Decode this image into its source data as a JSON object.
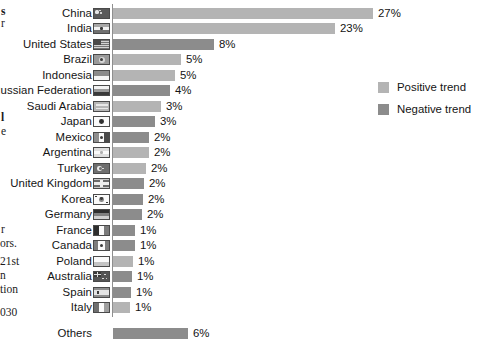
{
  "margin_text": {
    "lines": [
      {
        "text": "s",
        "top": 6,
        "left": 1,
        "bold": true
      },
      {
        "text": "r",
        "top": 18,
        "left": 1,
        "bold": false
      },
      {
        "text": "l",
        "top": 112,
        "left": 1,
        "bold": true
      },
      {
        "text": "e",
        "top": 126,
        "left": 1,
        "bold": false
      },
      {
        "text": "r",
        "top": 224,
        "left": 1,
        "bold": false
      },
      {
        "text": "ors.",
        "top": 238,
        "left": 0,
        "bold": false
      },
      {
        "text": "21st",
        "top": 256,
        "left": 0,
        "bold": false
      },
      {
        "text": "n",
        "top": 270,
        "left": 0,
        "bold": false
      },
      {
        "text": "tion",
        "top": 284,
        "left": 0,
        "bold": false
      },
      {
        "text": "030",
        "top": 307,
        "left": 0,
        "bold": false
      }
    ]
  },
  "legend": {
    "items": [
      {
        "label": "Positive trend",
        "color": "#b4b4b4",
        "swatch_name": "legend-swatch-positive"
      },
      {
        "label": "Negative trend",
        "color": "#8c8c8c",
        "swatch_name": "legend-swatch-negative"
      }
    ]
  },
  "chart_data": {
    "type": "bar",
    "orientation": "horizontal",
    "title": "",
    "xlabel": "",
    "ylabel": "",
    "xlim": [
      0,
      27
    ],
    "grid": false,
    "legend_position": "right",
    "value_suffix": "%",
    "series": [
      {
        "name": "Positive trend",
        "color": "#b4b4b4"
      },
      {
        "name": "Negative trend",
        "color": "#8c8c8c"
      }
    ],
    "categories": [
      "China",
      "India",
      "United States",
      "Brazil",
      "Indonesia",
      "Russian Federation",
      "Saudi Arabia",
      "Japan",
      "Mexico",
      "Argentina",
      "Turkey",
      "United Kingdom",
      "Korea",
      "Germany",
      "France",
      "Canada",
      "Poland",
      "Australia",
      "Spain",
      "Italy",
      "Others"
    ],
    "values": [
      27,
      23,
      8,
      5,
      5,
      4,
      3,
      3,
      2,
      2,
      2,
      2,
      2,
      2,
      1,
      1,
      1,
      1,
      1,
      1,
      6
    ],
    "labels": [
      "27%",
      "23%",
      "8%",
      "5%",
      "5%",
      "4%",
      "3%",
      "3%",
      "2%",
      "2%",
      "2%",
      "2%",
      "2%",
      "2%",
      "1%",
      "1%",
      "1%",
      "1%",
      "1%",
      "1%",
      "6%"
    ],
    "trends": [
      "positive",
      "positive",
      "negative",
      "positive",
      "positive",
      "negative",
      "positive",
      "negative",
      "negative",
      "positive",
      "positive",
      "negative",
      "negative",
      "negative",
      "negative",
      "negative",
      "positive",
      "negative",
      "negative",
      "positive",
      "negative"
    ],
    "bars": [
      {
        "category": "China",
        "label": "China",
        "value": 27,
        "value_label": "27%",
        "trend": "positive",
        "color": "#b4b4b4",
        "pixel_width": 260,
        "top": 6,
        "flag": "flag-china",
        "has_flag": true
      },
      {
        "category": "India",
        "label": "India",
        "value": 23,
        "value_label": "23%",
        "trend": "positive",
        "color": "#b4b4b4",
        "pixel_width": 222,
        "top": 21,
        "flag": "flag-india",
        "has_flag": true
      },
      {
        "category": "United States",
        "label": "United States",
        "value": 8,
        "value_label": "8%",
        "trend": "negative",
        "color": "#8c8c8c",
        "pixel_width": 101,
        "top": 37,
        "flag": "flag-united-states",
        "has_flag": true
      },
      {
        "category": "Brazil",
        "label": "Brazil",
        "value": 5,
        "value_label": "5%",
        "trend": "positive",
        "color": "#b4b4b4",
        "pixel_width": 68,
        "top": 52,
        "flag": "flag-brazil",
        "has_flag": true
      },
      {
        "category": "Indonesia",
        "label": "Indonesia",
        "value": 5,
        "value_label": "5%",
        "trend": "positive",
        "color": "#b4b4b4",
        "pixel_width": 62,
        "top": 68,
        "flag": "flag-indonesia",
        "has_flag": true
      },
      {
        "category": "Russian Federation",
        "label": "Russian Federation",
        "value": 4,
        "value_label": "4%",
        "trend": "negative",
        "color": "#8c8c8c",
        "pixel_width": 57,
        "top": 83,
        "flag": "flag-russia",
        "has_flag": true
      },
      {
        "category": "Saudi Arabia",
        "label": "Saudi Arabia",
        "value": 3,
        "value_label": "3%",
        "trend": "positive",
        "color": "#b4b4b4",
        "pixel_width": 48,
        "top": 99,
        "flag": "flag-saudi-arabia",
        "has_flag": true
      },
      {
        "category": "Japan",
        "label": "Japan",
        "value": 3,
        "value_label": "3%",
        "trend": "negative",
        "color": "#8c8c8c",
        "pixel_width": 42,
        "top": 114,
        "flag": "flag-japan",
        "has_flag": true
      },
      {
        "category": "Mexico",
        "label": "Mexico",
        "value": 2,
        "value_label": "2%",
        "trend": "negative",
        "color": "#8c8c8c",
        "pixel_width": 36,
        "top": 130,
        "flag": "flag-mexico",
        "has_flag": true
      },
      {
        "category": "Argentina",
        "label": "Argentina",
        "value": 2,
        "value_label": "2%",
        "trend": "positive",
        "color": "#b4b4b4",
        "pixel_width": 36,
        "top": 145,
        "flag": "flag-argentina",
        "has_flag": true
      },
      {
        "category": "Turkey",
        "label": "Turkey",
        "value": 2,
        "value_label": "2%",
        "trend": "positive",
        "color": "#b4b4b4",
        "pixel_width": 33,
        "top": 161,
        "flag": "flag-turkey",
        "has_flag": true
      },
      {
        "category": "United Kingdom",
        "label": "United Kingdom",
        "value": 2,
        "value_label": "2%",
        "trend": "negative",
        "color": "#8c8c8c",
        "pixel_width": 31,
        "top": 176,
        "flag": "flag-united-kingdom",
        "has_flag": true
      },
      {
        "category": "Korea",
        "label": "Korea",
        "value": 2,
        "value_label": "2%",
        "trend": "negative",
        "color": "#8c8c8c",
        "pixel_width": 30,
        "top": 192,
        "flag": "flag-korea",
        "has_flag": true
      },
      {
        "category": "Germany",
        "label": "Germany",
        "value": 2,
        "value_label": "2%",
        "trend": "negative",
        "color": "#8c8c8c",
        "pixel_width": 29,
        "top": 207,
        "flag": "flag-germany",
        "has_flag": true
      },
      {
        "category": "France",
        "label": "France",
        "value": 1,
        "value_label": "1%",
        "trend": "negative",
        "color": "#8c8c8c",
        "pixel_width": 22,
        "top": 223,
        "flag": "flag-france",
        "has_flag": true
      },
      {
        "category": "Canada",
        "label": "Canada",
        "value": 1,
        "value_label": "1%",
        "trend": "negative",
        "color": "#8c8c8c",
        "pixel_width": 22,
        "top": 238,
        "flag": "flag-canada",
        "has_flag": true
      },
      {
        "category": "Poland",
        "label": "Poland",
        "value": 1,
        "value_label": "1%",
        "trend": "positive",
        "color": "#b4b4b4",
        "pixel_width": 20,
        "top": 254,
        "flag": "flag-poland",
        "has_flag": true
      },
      {
        "category": "Australia",
        "label": "Australia",
        "value": 1,
        "value_label": "1%",
        "trend": "negative",
        "color": "#8c8c8c",
        "pixel_width": 19,
        "top": 269,
        "flag": "flag-australia",
        "has_flag": true
      },
      {
        "category": "Spain",
        "label": "Spain",
        "value": 1,
        "value_label": "1%",
        "trend": "negative",
        "color": "#8c8c8c",
        "pixel_width": 18,
        "top": 285,
        "flag": "flag-spain",
        "has_flag": true
      },
      {
        "category": "Italy",
        "label": "Italy",
        "value": 1,
        "value_label": "1%",
        "trend": "positive",
        "color": "#b4b4b4",
        "pixel_width": 17,
        "top": 300,
        "flag": "flag-italy",
        "has_flag": true
      },
      {
        "category": "Others",
        "label": "Others",
        "value": 6,
        "value_label": "6%",
        "trend": "negative",
        "color": "#8c8c8c",
        "pixel_width": 75,
        "top": 326,
        "flag": "",
        "has_flag": false
      }
    ]
  }
}
